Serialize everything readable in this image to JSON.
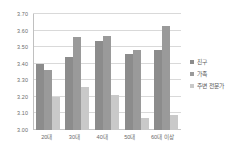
{
  "chart_data": {
    "type": "bar",
    "title": "",
    "subtitle": "",
    "xlabel": "",
    "ylabel": "",
    "categories": [
      "20대",
      "30대",
      "40대",
      "50대",
      "60대 이상"
    ],
    "series": [
      {
        "name": "친구",
        "color": "#8c8c8c",
        "values": [
          3.4,
          3.44,
          3.54,
          3.46,
          3.48
        ]
      },
      {
        "name": "가족",
        "color": "#9a9a9a",
        "values": [
          3.36,
          3.56,
          3.57,
          3.48,
          3.63
        ]
      },
      {
        "name": "주변 전문가",
        "color": "#c9c9c9",
        "values": [
          3.2,
          3.26,
          3.21,
          3.07,
          3.09
        ]
      }
    ],
    "ylim": [
      3.0,
      3.7
    ],
    "ytick_values": [
      3.0,
      3.1,
      3.2,
      3.3,
      3.4,
      3.5,
      3.6,
      3.7
    ],
    "ytick_labels": [
      "3.00",
      "3.10",
      "3.20",
      "3.30",
      "3.40",
      "3.50",
      "3.60",
      "3.70"
    ],
    "grid": true,
    "grid_axis": "y",
    "legend_position": "right",
    "background": "#ffffff"
  }
}
